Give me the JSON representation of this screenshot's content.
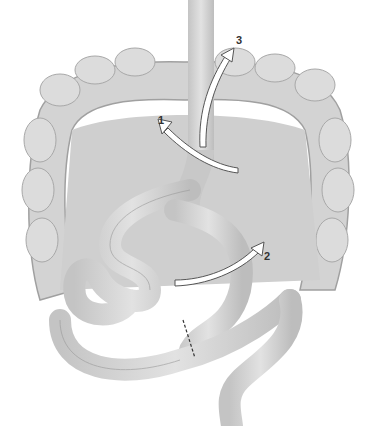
{
  "figure": {
    "labels": [
      {
        "id": "1",
        "text": "1",
        "x": 160,
        "y": 117
      },
      {
        "id": "2",
        "text": "2",
        "x": 264,
        "y": 251
      },
      {
        "id": "3",
        "text": "3",
        "x": 236,
        "y": 37
      }
    ],
    "colors": {
      "tissue": "#d6d6d6",
      "tissue_dark": "#b4b4b4",
      "outline": "#9a9a9a",
      "arrow_fill": "#ffffff",
      "arrow_stroke": "#555555"
    }
  }
}
